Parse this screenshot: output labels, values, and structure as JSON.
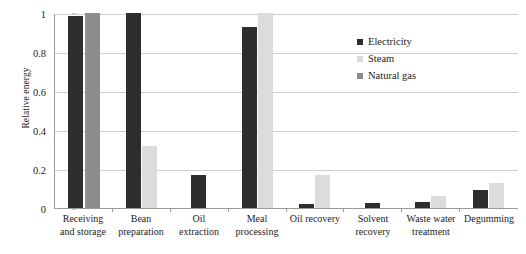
{
  "chart_data": {
    "type": "bar",
    "title": "",
    "xlabel": "",
    "ylabel": "Relative energy",
    "ylim": [
      0,
      1
    ],
    "yticks": [
      0,
      0.2,
      0.4,
      0.6,
      0.8,
      1
    ],
    "ytick_labels": [
      "0",
      "0.2",
      "0.4",
      "0.6",
      "0.8",
      "1"
    ],
    "grid": true,
    "legend_position": "upper right",
    "categories": [
      "Receiving and storage",
      "Bean preparation",
      "Oil extraction",
      "Meal processing",
      "Oil recovery",
      "Solvent recovery",
      "Waste water treatment",
      "Degumming"
    ],
    "category_lines": [
      [
        "Receiving",
        "and storage"
      ],
      [
        "Bean",
        "preparation"
      ],
      [
        "Oil",
        "extraction"
      ],
      [
        "Meal",
        "processing"
      ],
      [
        "Oil recovery",
        ""
      ],
      [
        "Solvent",
        "recovery"
      ],
      [
        "Waste water",
        "treatment"
      ],
      [
        "Degumming",
        ""
      ]
    ],
    "series": [
      {
        "name": "Electricity",
        "color": "#2e2e2e",
        "values": [
          0.985,
          1.0,
          0.17,
          0.93,
          0.02,
          0.025,
          0.03,
          0.09
        ]
      },
      {
        "name": "Steam",
        "color": "#dcdcdc",
        "values": [
          0,
          0.32,
          0,
          1.0,
          0.17,
          0,
          0.06,
          0.13
        ]
      },
      {
        "name": "Natural gas",
        "color": "#8d8d8d",
        "values": [
          1.0,
          0,
          0,
          0,
          0,
          0,
          0,
          0
        ]
      }
    ]
  }
}
